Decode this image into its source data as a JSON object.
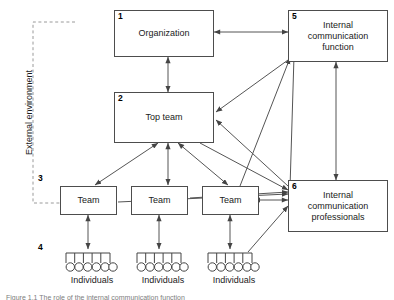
{
  "figure": {
    "external_environment_label": "External environment",
    "caption": "Figure 1.1 The role of the internal communication function"
  },
  "nodes": [
    {
      "id": "organization",
      "num": "1",
      "label": "Organization"
    },
    {
      "id": "top-team",
      "num": "2",
      "label": "Top team"
    },
    {
      "id": "team-left",
      "num": "3",
      "label": "Team"
    },
    {
      "id": "team-middle",
      "num": "",
      "label": "Team"
    },
    {
      "id": "team-right",
      "num": "",
      "label": "Team"
    },
    {
      "id": "individuals-left",
      "num": "4",
      "label": "Individuals"
    },
    {
      "id": "individuals-middle",
      "num": "",
      "label": "Individuals"
    },
    {
      "id": "individuals-right",
      "num": "",
      "label": "Individuals"
    },
    {
      "id": "ic-function",
      "num": "5",
      "label": "Internal\ncommunication\nfunction"
    },
    {
      "id": "ic-professionals",
      "num": "6",
      "label": "Internal\ncommunication\nprofessionals"
    }
  ],
  "node_text": {
    "organization": "Organization",
    "top_team": "Top team",
    "team_left": "Team",
    "team_middle": "Team",
    "team_right": "Team",
    "individuals_left": "Individuals",
    "individuals_middle": "Individuals",
    "individuals_right": "Individuals",
    "ic_function_line1": "Internal",
    "ic_function_line2": "communication",
    "ic_function_line3": "function",
    "ic_professionals_line1": "Internal",
    "ic_professionals_line2": "communication",
    "ic_professionals_line3": "professionals"
  },
  "node_numbers": {
    "organization": "1",
    "top_team": "2",
    "team_left": "3",
    "individuals_left": "4",
    "ic_function": "5",
    "ic_professionals": "6"
  },
  "connections": [
    {
      "from": "organization",
      "to": "top-team",
      "style": "double-arrow"
    },
    {
      "from": "organization",
      "to": "ic-function",
      "style": "double-arrow"
    },
    {
      "from": "ic-function",
      "to": "ic-professionals",
      "style": "double-arrow"
    },
    {
      "from": "top-team",
      "to": "team-left",
      "style": "double-arrow"
    },
    {
      "from": "top-team",
      "to": "team-middle",
      "style": "double-arrow"
    },
    {
      "from": "top-team",
      "to": "team-right",
      "style": "double-arrow"
    },
    {
      "from": "team-left",
      "to": "individuals-left",
      "style": "double-arrow"
    },
    {
      "from": "team-middle",
      "to": "individuals-middle",
      "style": "double-arrow"
    },
    {
      "from": "team-right",
      "to": "individuals-right",
      "style": "double-arrow"
    },
    {
      "from": "ic-function",
      "to": "top-team",
      "style": "single-arrow"
    },
    {
      "from": "ic-professionals",
      "to": "top-team",
      "style": "single-arrow"
    },
    {
      "from": "ic-professionals",
      "to": "team-right",
      "style": "double-arrow"
    },
    {
      "from": "top-team",
      "to": "ic-professionals",
      "style": "single-arrow"
    },
    {
      "from": "team-left",
      "to": "ic-professionals",
      "style": "single-arrow"
    },
    {
      "from": "team-middle",
      "to": "ic-professionals",
      "style": "single-arrow"
    },
    {
      "from": "individuals-right",
      "to": "ic-professionals",
      "style": "single-arrow"
    },
    {
      "from": "team-right",
      "to": "ic-function",
      "style": "single-arrow"
    },
    {
      "from": "ic-professionals",
      "to": "ic-function",
      "style": "single-arrow"
    }
  ],
  "individuals_per_group": 6,
  "colors": {
    "box_border": "#4d4d4d",
    "line": "#555555",
    "dashed_boundary": "#999999",
    "text": "#1a1a1a",
    "background": "#ffffff"
  }
}
